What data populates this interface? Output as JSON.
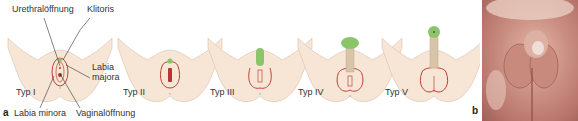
{
  "figure": {
    "panel_a": {
      "letter": "a",
      "annotations": {
        "urethra": "Urethralöffnung",
        "clitoris": "Klitoris",
        "labia_majora": "Labia\nmajora",
        "labia_majora_line1": "Labia",
        "labia_majora_line2": "majora",
        "labia_minora": "Labia minora",
        "vaginal_opening": "Vaginalöffnung"
      },
      "stages": [
        {
          "label": "Typ I"
        },
        {
          "label": "Typ II"
        },
        {
          "label": "Typ III"
        },
        {
          "label": "Typ IV"
        },
        {
          "label": "Typ V"
        }
      ]
    },
    "panel_b": {
      "letter": "b",
      "content": "clinical photograph"
    },
    "colors": {
      "skin": "#f7e6d6",
      "skin_outline": "#d9bfae",
      "labia_outline": "#c0403a",
      "clitoris_green": "#8cc46a",
      "shaft": "#d8c4a8",
      "leader_line": "#333333"
    }
  }
}
